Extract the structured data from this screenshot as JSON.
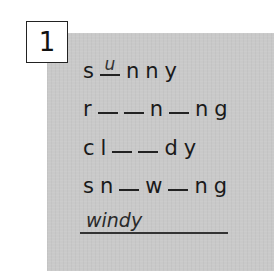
{
  "exercise": {
    "number": "1",
    "panel_color": "#c9c9c9",
    "words": [
      {
        "id": "sunny",
        "pattern": [
          "s",
          "_",
          "n",
          "n",
          "y"
        ],
        "filled": {
          "1": "u"
        }
      },
      {
        "id": "raining",
        "pattern": [
          "r",
          "_",
          "_",
          "n",
          "_",
          "n",
          "g"
        ],
        "filled": {}
      },
      {
        "id": "cloudy",
        "pattern": [
          "c",
          "l",
          "_",
          "_",
          "d",
          "y"
        ],
        "filled": {}
      },
      {
        "id": "snowing",
        "pattern": [
          "s",
          "n",
          "_",
          "w",
          "_",
          "n",
          "g"
        ],
        "filled": {}
      }
    ],
    "row1": {
      "c0": "s",
      "f1": "u",
      "c2": "n",
      "c3": "n",
      "c4": "y"
    },
    "row2": {
      "c0": "r",
      "c3": "n",
      "c5": "n",
      "c6": "g"
    },
    "row3": {
      "c0": "c",
      "c1": "l",
      "c4": "d",
      "c5": "y"
    },
    "row4": {
      "c0": "s",
      "c1": "n",
      "c3": "w",
      "c5": "n",
      "c6": "g"
    },
    "answer": {
      "text": "windy"
    }
  }
}
